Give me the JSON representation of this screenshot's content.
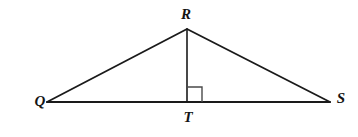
{
  "figure": {
    "kind": "geometry-diagram",
    "shape": "triangle-with-altitude",
    "background_color": "#ffffff",
    "stroke_color": "#1a1a1a",
    "right_angle_color": "#4a4a4a",
    "labels": {
      "apex": "R",
      "left": "Q",
      "right": "S",
      "foot": "T"
    },
    "points": {
      "Q": {
        "x": 47,
        "y": 102
      },
      "R": {
        "x": 187,
        "y": 29
      },
      "S": {
        "x": 330,
        "y": 102
      },
      "T": {
        "x": 187,
        "y": 102
      }
    },
    "label_positions": {
      "R": {
        "x": 186,
        "y": 14
      },
      "Q": {
        "x": 40,
        "y": 101
      },
      "S": {
        "x": 341,
        "y": 98
      },
      "T": {
        "x": 188,
        "y": 117
      }
    },
    "segments": [
      {
        "name": "QR",
        "from": "Q",
        "to": "R",
        "width": 1.8
      },
      {
        "name": "RS",
        "from": "R",
        "to": "S",
        "width": 1.8
      },
      {
        "name": "QS",
        "from": "Q",
        "to": "S",
        "width": 1.8
      },
      {
        "name": "RT",
        "from": "R",
        "to": "T",
        "width": 1.6
      }
    ],
    "right_angle_marker": {
      "at": "T",
      "side": "right",
      "size": 15,
      "width": 1.4
    }
  }
}
